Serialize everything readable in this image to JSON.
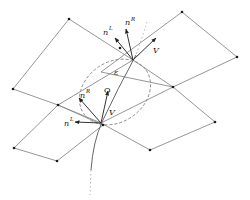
{
  "diagram": {
    "type": "mesh-interface-schematic",
    "colors": {
      "edges": "#8a8a8a",
      "nodes": "#1a1a1a",
      "arrows": "#333333",
      "background": "#ffffff"
    },
    "nodes": [
      {
        "id": "n1",
        "x": 69,
        "y": 19
      },
      {
        "id": "n2",
        "x": 182,
        "y": 12
      },
      {
        "id": "n3",
        "x": 237,
        "y": 57
      },
      {
        "id": "n4",
        "x": 120,
        "y": 48
      },
      {
        "id": "n5",
        "x": 13,
        "y": 89
      },
      {
        "id": "n6",
        "x": 173,
        "y": 87
      },
      {
        "id": "n7",
        "x": 58,
        "y": 105
      },
      {
        "id": "n8",
        "x": 103,
        "y": 125
      },
      {
        "id": "n9",
        "x": 215,
        "y": 122
      },
      {
        "id": "n10",
        "x": 150,
        "y": 150
      },
      {
        "id": "n11",
        "x": 14,
        "y": 148
      },
      {
        "id": "n12",
        "x": 57,
        "y": 161
      }
    ],
    "labels": {
      "upper": {
        "nL_base": "n",
        "nL_sup": "L",
        "nR_base": "n",
        "nR_sup": "R",
        "V": "V",
        "epsilon": "ε"
      },
      "lower": {
        "nL_base": "n",
        "nL_sup": "L",
        "nR_base": "n",
        "nR_sup": "R",
        "V": "V",
        "O": "O"
      }
    }
  }
}
